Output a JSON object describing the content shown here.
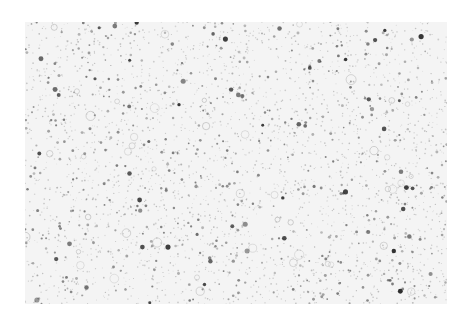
{
  "image": {
    "description": "grayscale speckled surface texture",
    "frame": {
      "x": 25,
      "y": 22,
      "width": 422,
      "height": 282
    },
    "background_color": "#ffffff",
    "texture_base_color": "#f4f4f4",
    "speckles": {
      "seed": 1337,
      "fine_count": 2600,
      "medium_count": 520,
      "large_count": 70,
      "ring_count": 45,
      "colors": {
        "fine": "#b8b8b8",
        "medium": "#7a7a7a",
        "large": "#2e2e2e",
        "ring": "#a0a0a0"
      },
      "radius_ranges": {
        "fine": [
          0.4,
          0.9
        ],
        "medium": [
          0.8,
          1.5
        ],
        "large": [
          1.4,
          2.6
        ],
        "ring": [
          2.0,
          5.0
        ]
      }
    }
  }
}
